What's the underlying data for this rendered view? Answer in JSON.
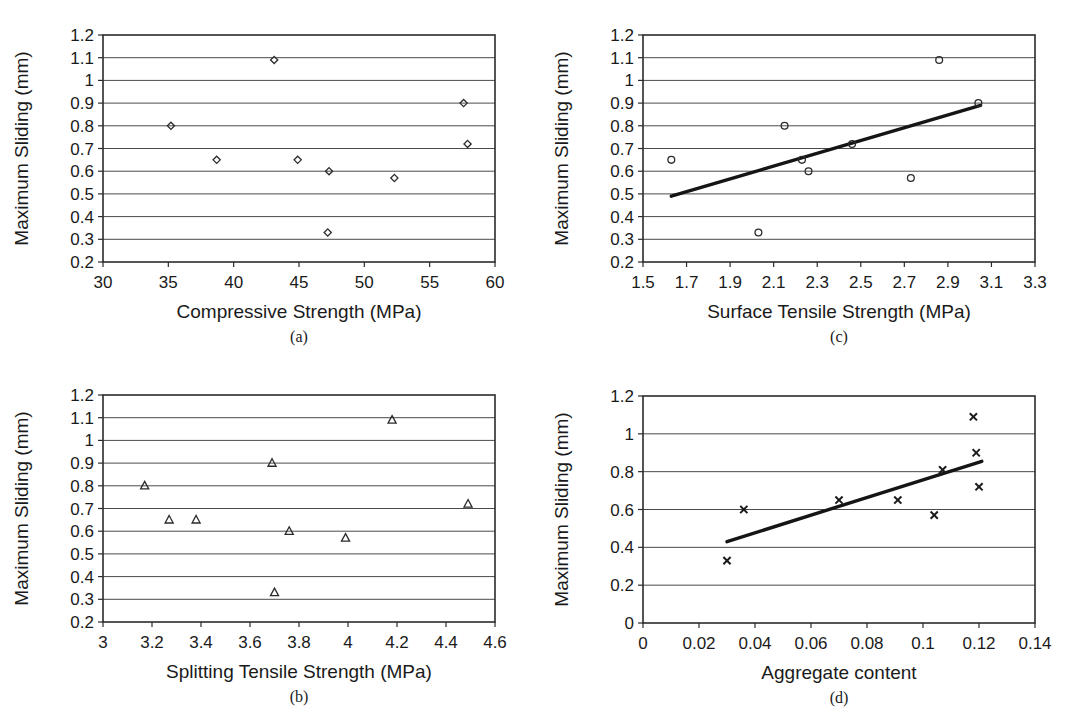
{
  "figure": {
    "background_color": "#ffffff",
    "marker_color": "#2b2b2b",
    "trendline_color": "#151515",
    "grid_color": "#4a4a4a"
  },
  "chart_data": [
    {
      "id": "a",
      "caption": "(a)",
      "type": "scatter",
      "title": "",
      "xlabel": "Compressive Strength (MPa)",
      "ylabel": "Maximum Sliding (mm)",
      "xlim": [
        30,
        60
      ],
      "ylim": [
        0.2,
        1.2
      ],
      "xticks": [
        30,
        35,
        40,
        45,
        50,
        55,
        60
      ],
      "xtick_labels": [
        "30",
        "35",
        "40",
        "45",
        "50",
        "55",
        "60"
      ],
      "yticks": [
        0.2,
        0.3,
        0.4,
        0.5,
        0.6,
        0.7,
        0.8,
        0.9,
        1.0,
        1.1,
        1.2
      ],
      "ytick_labels": [
        "0.2",
        "0.3",
        "0.4",
        "0.5",
        "0.6",
        "0.7",
        "0.8",
        "0.9",
        "1",
        "1.1",
        "1.2"
      ],
      "grid": true,
      "legend": "none",
      "marker": "diamond",
      "trendline": null,
      "x": [
        35.2,
        38.7,
        43.1,
        44.9,
        47.2,
        47.3,
        52.3,
        57.6,
        57.9
      ],
      "y": [
        0.8,
        0.65,
        1.09,
        0.65,
        0.33,
        0.6,
        0.57,
        0.9,
        0.72
      ]
    },
    {
      "id": "b",
      "caption": "(b)",
      "type": "scatter",
      "title": "",
      "xlabel": "Splitting Tensile Strength (MPa)",
      "ylabel": "Maximum Sliding (mm)",
      "xlim": [
        3,
        4.6
      ],
      "ylim": [
        0.2,
        1.2
      ],
      "xticks": [
        3,
        3.2,
        3.4,
        3.6,
        3.8,
        4,
        4.2,
        4.4,
        4.6
      ],
      "xtick_labels": [
        "3",
        "3.2",
        "3.4",
        "3.6",
        "3.8",
        "4",
        "4.2",
        "4.4",
        "4.6"
      ],
      "yticks": [
        0.2,
        0.3,
        0.4,
        0.5,
        0.6,
        0.7,
        0.8,
        0.9,
        1.0,
        1.1,
        1.2
      ],
      "ytick_labels": [
        "0.2",
        "0.3",
        "0.4",
        "0.5",
        "0.6",
        "0.7",
        "0.8",
        "0.9",
        "1",
        "1.1",
        "1.2"
      ],
      "grid": true,
      "legend": "none",
      "marker": "triangle",
      "trendline": null,
      "x": [
        3.17,
        3.27,
        3.38,
        3.69,
        3.7,
        3.76,
        3.99,
        4.18,
        4.49
      ],
      "y": [
        0.8,
        0.65,
        0.65,
        0.9,
        0.33,
        0.6,
        0.57,
        1.09,
        0.72
      ]
    },
    {
      "id": "c",
      "caption": "(c)",
      "type": "scatter",
      "title": "",
      "xlabel": "Surface Tensile Strength (MPa)",
      "ylabel": "Maximum Sliding (mm)",
      "xlim": [
        1.5,
        3.3
      ],
      "ylim": [
        0.2,
        1.2
      ],
      "xticks": [
        1.5,
        1.7,
        1.9,
        2.1,
        2.3,
        2.5,
        2.7,
        2.9,
        3.1,
        3.3
      ],
      "xtick_labels": [
        "1.5",
        "1.7",
        "1.9",
        "2.1",
        "2.3",
        "2.5",
        "2.7",
        "2.9",
        "3.1",
        "3.3"
      ],
      "yticks": [
        0.2,
        0.3,
        0.4,
        0.5,
        0.6,
        0.7,
        0.8,
        0.9,
        1.0,
        1.1,
        1.2
      ],
      "ytick_labels": [
        "0.2",
        "0.3",
        "0.4",
        "0.5",
        "0.6",
        "0.7",
        "0.8",
        "0.9",
        "1",
        "1.1",
        "1.2"
      ],
      "grid": true,
      "legend": "none",
      "marker": "circle",
      "trendline": {
        "x": [
          1.63,
          3.05
        ],
        "y": [
          0.49,
          0.89
        ]
      },
      "x": [
        1.63,
        2.03,
        2.15,
        2.23,
        2.26,
        2.46,
        2.73,
        2.86,
        3.04
      ],
      "y": [
        0.65,
        0.33,
        0.8,
        0.65,
        0.6,
        0.72,
        0.57,
        1.09,
        0.9
      ]
    },
    {
      "id": "d",
      "caption": "(d)",
      "type": "scatter",
      "title": "",
      "xlabel": "Aggregate content",
      "ylabel": "Maximum Sliding  (mm)",
      "xlim": [
        0,
        0.14
      ],
      "ylim": [
        0,
        1.2
      ],
      "xticks": [
        0,
        0.02,
        0.04,
        0.06,
        0.08,
        0.1,
        0.12,
        0.14
      ],
      "xtick_labels": [
        "0",
        "0.02",
        "0.04",
        "0.06",
        "0.08",
        "0.1",
        "0.12",
        "0.14"
      ],
      "yticks": [
        0,
        0.2,
        0.4,
        0.6,
        0.8,
        1.0,
        1.2
      ],
      "ytick_labels": [
        "0",
        "0.2",
        "0.4",
        "0.6",
        "0.8",
        "1",
        "1.2"
      ],
      "grid": true,
      "legend": "none",
      "marker": "x",
      "trendline": {
        "x": [
          0.03,
          0.121
        ],
        "y": [
          0.43,
          0.855
        ]
      },
      "x": [
        0.03,
        0.036,
        0.07,
        0.091,
        0.104,
        0.107,
        0.118,
        0.119,
        0.12
      ],
      "y": [
        0.33,
        0.6,
        0.65,
        0.65,
        0.57,
        0.81,
        1.09,
        0.9,
        0.72
      ]
    }
  ]
}
